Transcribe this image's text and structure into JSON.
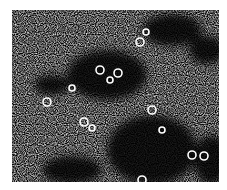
{
  "image": {
    "kind": "micrograph",
    "description": "Grainy black-and-white electron micrograph showing speckled background with dark clustered regions containing small ring-shaped particles",
    "colors": {
      "background": "#ffffff",
      "dark": "#000000",
      "light": "#ffffff"
    },
    "dark_regions": [
      {
        "cx": 95,
        "cy": 65,
        "rx": 40,
        "ry": 25
      },
      {
        "cx": 140,
        "cy": 140,
        "rx": 45,
        "ry": 35
      },
      {
        "cx": 160,
        "cy": 20,
        "rx": 30,
        "ry": 16
      },
      {
        "cx": 195,
        "cy": 40,
        "rx": 18,
        "ry": 14
      },
      {
        "cx": 40,
        "cy": 75,
        "rx": 18,
        "ry": 10
      },
      {
        "cx": 60,
        "cy": 160,
        "rx": 30,
        "ry": 14
      },
      {
        "cx": 200,
        "cy": 150,
        "rx": 18,
        "ry": 25
      }
    ],
    "rings": [
      {
        "cx": 88,
        "cy": 60,
        "r": 4
      },
      {
        "cx": 106,
        "cy": 63,
        "r": 4
      },
      {
        "cx": 98,
        "cy": 70,
        "r": 3
      },
      {
        "cx": 35,
        "cy": 92,
        "r": 4
      },
      {
        "cx": 128,
        "cy": 32,
        "r": 4
      },
      {
        "cx": 134,
        "cy": 22,
        "r": 3
      },
      {
        "cx": 72,
        "cy": 112,
        "r": 4
      },
      {
        "cx": 80,
        "cy": 118,
        "r": 3
      },
      {
        "cx": 140,
        "cy": 100,
        "r": 4
      },
      {
        "cx": 180,
        "cy": 145,
        "r": 4
      },
      {
        "cx": 192,
        "cy": 146,
        "r": 4
      },
      {
        "cx": 130,
        "cy": 170,
        "r": 4
      },
      {
        "cx": 150,
        "cy": 120,
        "r": 3
      },
      {
        "cx": 60,
        "cy": 78,
        "r": 3
      }
    ]
  }
}
